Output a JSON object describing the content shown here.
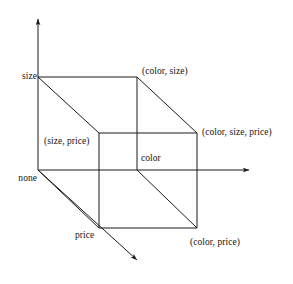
{
  "figure": {
    "type": "lattice-diagram",
    "stroke_color": "#1a1a1a",
    "background_color": "#ffffff",
    "axes": [
      {
        "name": "vertical-axis",
        "from": [
          38,
          170
        ],
        "to": [
          38,
          16
        ],
        "arrow": true
      },
      {
        "name": "horizontal-axis",
        "from": [
          38,
          170
        ],
        "to": [
          252,
          170
        ],
        "arrow": true
      },
      {
        "name": "diagonal-axis",
        "from": [
          38,
          170
        ],
        "to": [
          139,
          262
        ],
        "arrow": true
      }
    ],
    "vertices": {
      "none": {
        "x": 38,
        "y": 170
      },
      "size": {
        "x": 38,
        "y": 77
      },
      "color": {
        "x": 137,
        "y": 170
      },
      "price": {
        "x": 99,
        "y": 228
      },
      "color_size": {
        "x": 137,
        "y": 77
      },
      "size_price": {
        "x": 99,
        "y": 133
      },
      "color_price": {
        "x": 197,
        "y": 228
      },
      "color_size_price": {
        "x": 197,
        "y": 133
      }
    },
    "labels": {
      "size": "size",
      "none": "none",
      "color_size": "(color, size)",
      "color_size_price": "(color, size, price)",
      "size_price": "(size, price)",
      "color": "color",
      "price": "price",
      "color_price": "(color, price)"
    }
  }
}
